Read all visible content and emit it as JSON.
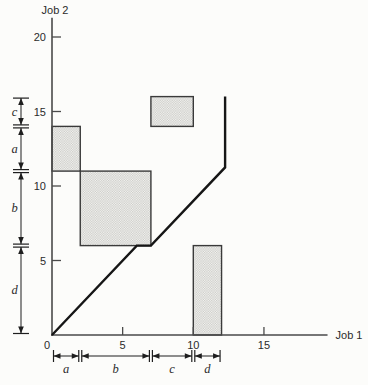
{
  "figure": {
    "background": "#fcfcfa"
  },
  "chart_data": {
    "type": "line",
    "title": "",
    "xlabel": "Job 1",
    "ylabel": "Job 2",
    "xlim": [
      0,
      19.5
    ],
    "ylim": [
      0,
      21.3
    ],
    "x_ticks": [
      0,
      5,
      10,
      15
    ],
    "y_ticks": [
      5,
      10,
      15,
      20
    ],
    "grid": false,
    "schedule_path": [
      [
        0,
        0
      ],
      [
        6,
        6
      ],
      [
        7,
        6
      ],
      [
        12.25,
        11.25
      ],
      [
        12.25,
        16
      ]
    ],
    "conflict_rects": [
      {
        "machine": "a",
        "x0": 0,
        "x1": 2,
        "y0": 11,
        "y1": 14
      },
      {
        "machine": "b",
        "x0": 2,
        "x1": 7,
        "y0": 6,
        "y1": 11
      },
      {
        "machine": "c",
        "x0": 7,
        "x1": 10,
        "y0": 14,
        "y1": 16
      },
      {
        "machine": "d",
        "x0": 10,
        "x1": 12,
        "y0": 0,
        "y1": 6
      }
    ],
    "bottom_intervals": [
      {
        "label": "a",
        "from": 0,
        "to": 2
      },
      {
        "label": "b",
        "from": 2,
        "to": 7
      },
      {
        "label": "c",
        "from": 7,
        "to": 10
      },
      {
        "label": "d",
        "from": 10,
        "to": 12
      }
    ],
    "left_intervals": [
      {
        "label": "d",
        "from": 0,
        "to": 6
      },
      {
        "label": "b",
        "from": 6,
        "to": 11
      },
      {
        "label": "a",
        "from": 11,
        "to": 14
      },
      {
        "label": "c",
        "from": 14,
        "to": 16
      }
    ],
    "colors": {
      "axis": "#4a4a4a",
      "path": "#161616",
      "rect_fill_base": "#f6f6f3",
      "rect_fill_dot": "#c9c9c5",
      "rect_border": "#3a3a3a",
      "dim": "#1e1e1e",
      "text": "#2b2b2b"
    }
  }
}
